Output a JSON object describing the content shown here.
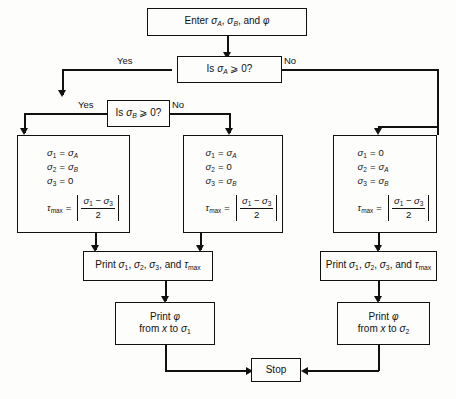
{
  "diagram": {
    "line_color": "#111111",
    "background_color": "#fdfdfb"
  },
  "nodes": {
    "enter": {
      "id": "enter",
      "type": "process",
      "text": "Enter σA, σB, and φ",
      "parts": {
        "lead": "Enter ",
        "s1": "σ",
        "s1sub": "A",
        "sep1": ", ",
        "s2": "σ",
        "s2sub": "B",
        "sep2": ", and ",
        "phi": "φ"
      }
    },
    "decision_a": {
      "id": "decision-sigma-a",
      "type": "decision",
      "text": "Is σA ⩾ 0?",
      "parts": {
        "lead": "Is ",
        "sym": "σ",
        "sub": "A",
        "tail": " ⩾ 0?"
      },
      "yes_label": "Yes",
      "no_label": "No"
    },
    "decision_b": {
      "id": "decision-sigma-b",
      "type": "decision",
      "text": "Is σB ⩾ 0?",
      "parts": {
        "lead": "Is ",
        "sym": "σ",
        "sub": "B",
        "tail": " ⩾ 0?"
      },
      "yes_label": "Yes",
      "no_label": "No"
    },
    "assign_left": {
      "id": "assign-left",
      "type": "process",
      "assignments": [
        {
          "lhs_sym": "σ",
          "lhs_sub": "1",
          "rhs_sym": "σ",
          "rhs_sub": "A"
        },
        {
          "lhs_sym": "σ",
          "lhs_sub": "2",
          "rhs_sym": "σ",
          "rhs_sub": "B"
        },
        {
          "lhs_sym": "σ",
          "lhs_sub": "3",
          "rhs_sym": "0",
          "rhs_sub": ""
        }
      ],
      "tau": {
        "lhs_sym": "τ",
        "lhs_sub": "max",
        "numerator_a_sym": "σ",
        "numerator_a_sub": "1",
        "operator": "−",
        "numerator_b_sym": "σ",
        "numerator_b_sub": "3",
        "denominator": "2"
      }
    },
    "assign_mid": {
      "id": "assign-middle",
      "type": "process",
      "assignments": [
        {
          "lhs_sym": "σ",
          "lhs_sub": "1",
          "rhs_sym": "σ",
          "rhs_sub": "A"
        },
        {
          "lhs_sym": "σ",
          "lhs_sub": "2",
          "rhs_sym": "0",
          "rhs_sub": ""
        },
        {
          "lhs_sym": "σ",
          "lhs_sub": "3",
          "rhs_sym": "σ",
          "rhs_sub": "B"
        }
      ],
      "tau": {
        "lhs_sym": "τ",
        "lhs_sub": "max",
        "numerator_a_sym": "σ",
        "numerator_a_sub": "1",
        "operator": "−",
        "numerator_b_sym": "σ",
        "numerator_b_sub": "3",
        "denominator": "2"
      }
    },
    "assign_right": {
      "id": "assign-right",
      "type": "process",
      "assignments": [
        {
          "lhs_sym": "σ",
          "lhs_sub": "1",
          "rhs_sym": "0",
          "rhs_sub": ""
        },
        {
          "lhs_sym": "σ",
          "lhs_sub": "2",
          "rhs_sym": "σ",
          "rhs_sub": "A"
        },
        {
          "lhs_sym": "σ",
          "lhs_sub": "3",
          "rhs_sym": "σ",
          "rhs_sub": "B"
        }
      ],
      "tau": {
        "lhs_sym": "τ",
        "lhs_sub": "max",
        "numerator_a_sym": "σ",
        "numerator_a_sub": "1",
        "operator": "−",
        "numerator_b_sym": "σ",
        "numerator_b_sub": "3",
        "denominator": "2"
      }
    },
    "print_left": {
      "id": "print-results-left",
      "type": "output",
      "text": "Print σ1, σ2, σ3, and τmax"
    },
    "print_right": {
      "id": "print-results-right",
      "type": "output",
      "text": "Print σ1, σ2, σ3, and τmax"
    },
    "printphi_left": {
      "id": "print-phi-left",
      "type": "output",
      "line1": "Print φ",
      "line2_lead": "from ",
      "line2_x": "x",
      "line2_mid": " to ",
      "line2_sym": "σ",
      "line2_sub": "1"
    },
    "printphi_right": {
      "id": "print-phi-right",
      "type": "output",
      "line1": "Print φ",
      "line2_lead": "from ",
      "line2_x": "x",
      "line2_mid": " to ",
      "line2_sym": "σ",
      "line2_sub": "2"
    },
    "stop": {
      "id": "stop",
      "type": "terminator",
      "text": "Stop"
    }
  },
  "edge_labels": {
    "a_yes": "Yes",
    "a_no": "No",
    "b_yes": "Yes",
    "b_no": "No"
  }
}
